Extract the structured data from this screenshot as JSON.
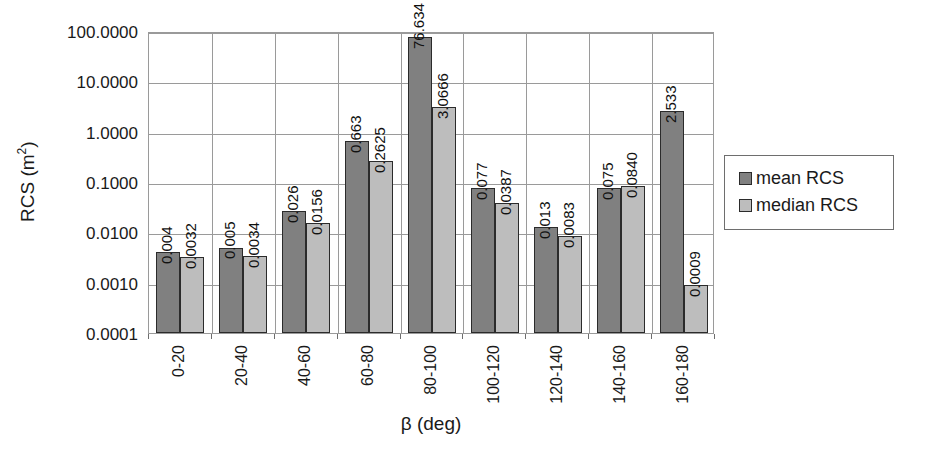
{
  "chart_data": {
    "type": "bar",
    "title": "",
    "xlabel": "β (deg)",
    "ylabel": "RCS (m",
    "ylabel_sup": "2",
    "ylabel_suffix": ")",
    "yscale": "log",
    "ylim": [
      0.0001,
      100
    ],
    "grid": true,
    "legend_position": "right",
    "categories": [
      "0-20",
      "20-40",
      "40-60",
      "60-80",
      "80-100",
      "100-120",
      "120-140",
      "140-160",
      "160-180"
    ],
    "y_ticks": [
      "0.0001",
      "0.0010",
      "0.0100",
      "0.1000",
      "1.0000",
      "10.0000",
      "100.0000"
    ],
    "y_tick_values": [
      0.0001,
      0.001,
      0.01,
      0.1,
      1,
      10,
      100
    ],
    "series": [
      {
        "name": "mean RCS",
        "color": "#808080",
        "values": [
          0.004,
          0.005,
          0.026,
          0.663,
          76.634,
          0.077,
          0.013,
          0.075,
          2.533
        ],
        "labels": [
          "0.004",
          "0.005",
          "0.026",
          "0.663",
          "76.634",
          "0.077",
          "0.013",
          "0.075",
          "2.533"
        ]
      },
      {
        "name": "median RCS",
        "color": "#bdbdbd",
        "values": [
          0.0032,
          0.0034,
          0.0156,
          0.2625,
          3.0666,
          0.0387,
          0.0083,
          0.084,
          0.0009
        ],
        "labels": [
          "0.0032",
          "0.0034",
          "0.0156",
          "0.2625",
          "3.0666",
          "0.0387",
          "0.0083",
          "0.0840",
          "0.0009"
        ]
      }
    ]
  },
  "legend": {
    "items": [
      {
        "label": "mean RCS",
        "swatch": "mean"
      },
      {
        "label": "median RCS",
        "swatch": "median"
      }
    ]
  },
  "colors": {
    "mean": "#808080",
    "median": "#bdbdbd",
    "axis": "#9a9a9a",
    "text": "#1a1a1a"
  }
}
